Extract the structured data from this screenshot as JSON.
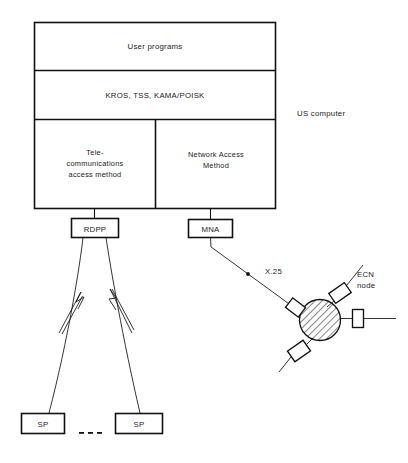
{
  "figure": {
    "background": "#ffffff",
    "line_color": "#111111"
  },
  "host": {
    "label": "US computer",
    "layers": [
      {
        "name": "user-programs",
        "label": "User programs"
      },
      {
        "name": "operating-systems",
        "label": "KROS, TSS, KAMA/POISK"
      },
      {
        "name": "telecom-access-method",
        "label_lines": [
          "Tele-",
          "communications",
          "access method"
        ]
      },
      {
        "name": "network-access-method",
        "label_lines": [
          "Network Access",
          "Method"
        ]
      }
    ]
  },
  "controllers": [
    {
      "name": "rdpp",
      "label": "RDPP"
    },
    {
      "name": "mna",
      "label": "MNA"
    }
  ],
  "terminals": [
    {
      "name": "sp-left",
      "label": "SP"
    },
    {
      "name": "sp-right",
      "label": "SP"
    }
  ],
  "ellipsis": "...",
  "network": {
    "protocol_label": "X.25",
    "node_label_lines": [
      "ECN",
      "node"
    ],
    "node_fill": "hatched",
    "port_count": 4
  }
}
